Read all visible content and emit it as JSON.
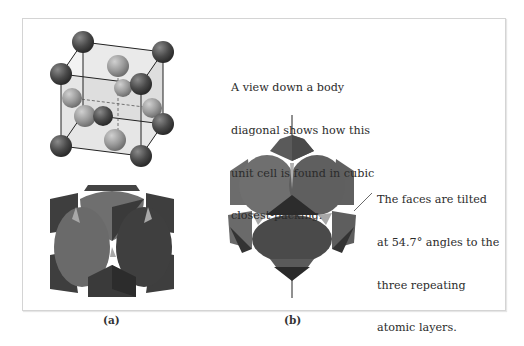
{
  "figure": {
    "panel_a": {
      "label": "(a)",
      "top_view": "fcc-unit-cell-ball-and-stick",
      "bottom_view": "fcc-unit-cell-space-filling"
    },
    "panel_b": {
      "label": "(b)",
      "view": "body-diagonal-view-cubic-closest-packing"
    },
    "annotations": {
      "body_diagonal": {
        "lines": [
          "A view down a body",
          "diagonal shows how this",
          "unit cell is found in cubic",
          "closest-packing."
        ]
      },
      "faces_tilted": {
        "lines": [
          "The faces are tilted",
          "at 54.7° angles to the",
          "three repeating",
          "atomic layers."
        ]
      }
    },
    "colors": {
      "corner_atom": "#4a4a4a",
      "face_atom": "#8c8c8c",
      "cube_face": "#d9d9d9",
      "edge": "#222222",
      "panel_border": "#d4d4d4"
    }
  }
}
